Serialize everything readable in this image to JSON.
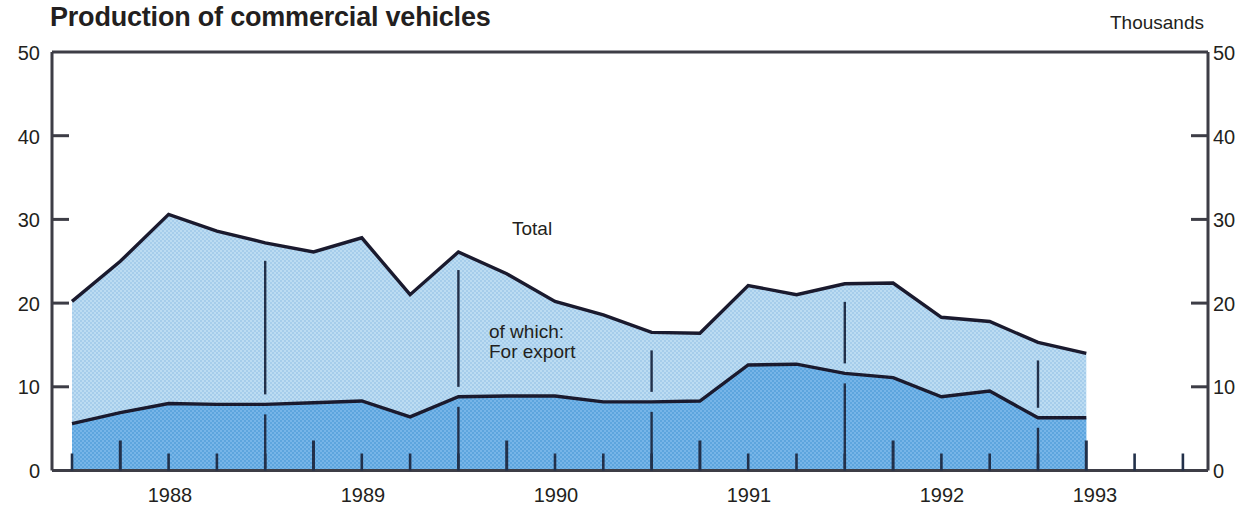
{
  "chart_data": {
    "type": "area",
    "title": "Production of commercial vehicles",
    "units_label": "Thousands",
    "xlabel": "",
    "ylabel": "",
    "ylim": [
      0,
      50
    ],
    "yticks": [
      0,
      10,
      20,
      30,
      40,
      50
    ],
    "ytick_labels": [
      "0",
      "10",
      "20",
      "30",
      "40",
      "50"
    ],
    "grid": false,
    "legend_position": "inline-annotations",
    "stacked": false,
    "x_axis_type": "quarterly",
    "xlim": [
      "1987 Q4",
      "1993 Q2"
    ],
    "xtick_labels": [
      "1988",
      "1989",
      "1990",
      "1991",
      "1992",
      "1993"
    ],
    "x": [
      "1987 Q4",
      "1988 Q1",
      "1988 Q2",
      "1988 Q3",
      "1988 Q4",
      "1989 Q1",
      "1989 Q2",
      "1989 Q3",
      "1989 Q4",
      "1990 Q1",
      "1990 Q2",
      "1990 Q3",
      "1990 Q4",
      "1991 Q1",
      "1991 Q2",
      "1991 Q3",
      "1991 Q4",
      "1992 Q1",
      "1992 Q2",
      "1992 Q3",
      "1992 Q4",
      "1993 Q1"
    ],
    "series": [
      {
        "name": "Total",
        "annotation": "Total",
        "color": "#b2d6ef",
        "values": [
          20.2,
          25.0,
          30.6,
          28.6,
          27.2,
          26.1,
          27.8,
          21.0,
          26.1,
          23.5,
          20.2,
          18.6,
          16.5,
          16.4,
          22.1,
          21.0,
          22.3,
          22.4,
          18.3,
          17.8,
          15.3,
          14.0
        ]
      },
      {
        "name": "of which: For export",
        "annotation": "of which:\nFor export",
        "color": "#6aaee4",
        "values": [
          5.6,
          6.9,
          8.0,
          7.9,
          7.9,
          8.1,
          8.3,
          6.4,
          8.8,
          8.9,
          8.9,
          8.2,
          8.2,
          8.3,
          12.6,
          12.7,
          11.6,
          11.1,
          8.8,
          9.5,
          6.3,
          6.3
        ]
      }
    ],
    "annotations": [
      {
        "text": "Total",
        "x": "1990 Q1"
      },
      {
        "text": "of which:\nFor export",
        "x": "1990 Q2"
      }
    ]
  },
  "axis": {
    "left_ticks": [
      "50",
      "40",
      "30",
      "20",
      "10",
      "0"
    ],
    "right_ticks": [
      "50",
      "40",
      "30",
      "20",
      "10",
      "0"
    ],
    "x_labels": [
      "1988",
      "1989",
      "1990",
      "1991",
      "1992",
      "1993"
    ]
  },
  "annotations": {
    "total": "Total",
    "export_line1": "of which:",
    "export_line2": "For export"
  },
  "colors": {
    "total_fill": "#b2d6ef",
    "export_fill": "#6aaee4",
    "line": "#1a1a2e",
    "axis": "#3d3d46",
    "text": "#231f20",
    "background": "#ffffff"
  }
}
